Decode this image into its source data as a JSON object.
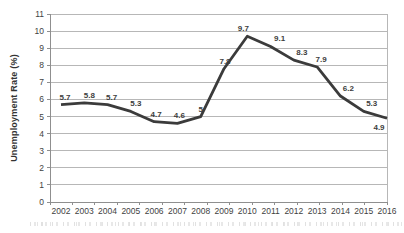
{
  "chart_data": {
    "type": "line",
    "title": "",
    "xlabel": "",
    "ylabel": "Unemployment Rate (%)",
    "categories": [
      "2002",
      "2003",
      "2004",
      "2005",
      "2006",
      "2007",
      "2008",
      "2009",
      "2010",
      "2011",
      "2012",
      "2013",
      "2014",
      "2015",
      "2016"
    ],
    "values": [
      5.7,
      5.8,
      5.7,
      5.3,
      4.7,
      4.6,
      5,
      7.8,
      9.7,
      9.1,
      8.3,
      7.9,
      6.2,
      5.3,
      4.9
    ],
    "point_labels": [
      "5.7",
      "5.8",
      "5.7",
      "5.3",
      "4.7",
      "4.6",
      "5",
      "7.8",
      "9.7",
      "9.1",
      "8.3",
      "7.9",
      "6.2",
      "5.3",
      "4.9"
    ],
    "ylim": [
      0,
      11
    ],
    "y_ticks": [
      0,
      1,
      2,
      3,
      4,
      5,
      6,
      7,
      8,
      9,
      10,
      11
    ],
    "grid": "horizontal",
    "legend": "none",
    "line_color": "#3b3b3b",
    "line_width": 2.8,
    "grid_color": "#b7b7b7",
    "axis_color": "#8f8f8f",
    "text_color": "#3f3f3f",
    "layout": {
      "plot": {
        "left": 50,
        "top": 14,
        "right": 387,
        "bottom": 202
      },
      "x_first": 61,
      "x_last": 387,
      "x_boundary_ticks": 15,
      "tick_length": 3,
      "x_label_baseline_offset": 12,
      "label_dx": [
        4,
        5,
        4,
        5,
        2,
        2,
        0,
        1,
        -4,
        9,
        8,
        4,
        8,
        8,
        -8
      ],
      "label_dy": [
        -5,
        -5,
        -5,
        -5,
        -5,
        -5,
        -5,
        -5,
        -5,
        -5,
        -5,
        -5,
        -5,
        -5,
        12
      ]
    }
  }
}
